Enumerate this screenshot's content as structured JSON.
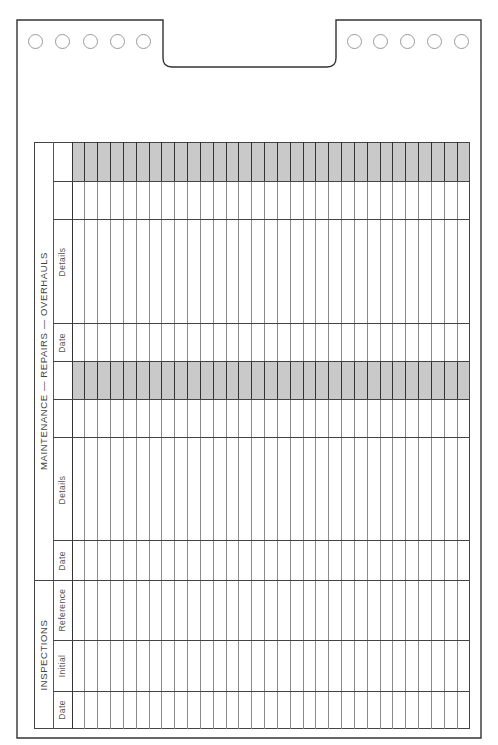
{
  "card": {
    "holes_left": 5,
    "holes_right": 5,
    "shade_color": "#c9c9c9"
  },
  "sections": {
    "maintenance": {
      "title": "MAINTENANCE — REPAIRS — OVERHAULS",
      "columns": [
        {
          "label": ""
        },
        {
          "label": ""
        },
        {
          "label": "Details"
        },
        {
          "label": "Date"
        },
        {
          "label": ""
        },
        {
          "label": ""
        },
        {
          "label": "Details"
        },
        {
          "label": "Date"
        }
      ]
    },
    "inspections": {
      "title": "INSPECTIONS",
      "columns": [
        {
          "label": "Reference"
        },
        {
          "label": "Initial"
        },
        {
          "label": "Date"
        }
      ]
    }
  },
  "grid": {
    "entry_rows": 31
  }
}
